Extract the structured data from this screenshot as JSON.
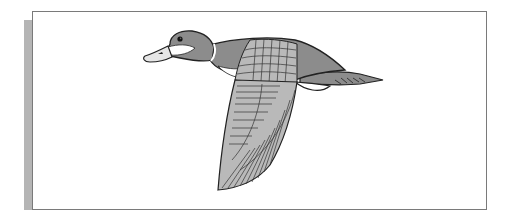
{
  "illustration": {
    "subject": "flying duck (drake) in side view",
    "colors": {
      "body": "#8c8c8c",
      "wing": "#b9b9b9",
      "bill": "#e6e6e6",
      "patch": "#ffffff",
      "outline": "#222222",
      "frame_border": "#7a7a7a",
      "shadow_bar": "#b5b5b5"
    }
  }
}
